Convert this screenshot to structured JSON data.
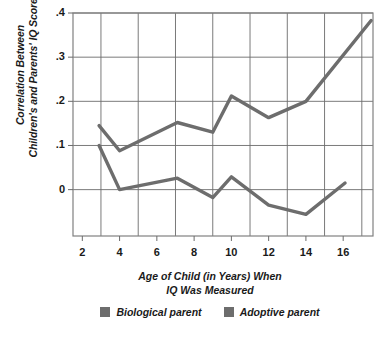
{
  "chart_data": {
    "type": "line",
    "title": "",
    "xlabel": "Age of Child (in Years) When IQ Was Measured",
    "xlabel_line1": "Age of Child (in Years) When",
    "xlabel_line2": "IQ Was Measured",
    "ylabel": "Correlation Between Children's and Parents' IQ Scores",
    "ylabel_line1": "Correlation Between",
    "ylabel_line2": "Children's and Parents' IQ Scores",
    "xlim": [
      1.5,
      17.6
    ],
    "ylim": [
      -0.105,
      0.4
    ],
    "xticks": [
      2,
      4,
      6,
      8,
      10,
      12,
      14,
      16
    ],
    "xtick_labels": [
      "2",
      "4",
      "6",
      "8",
      "10",
      "12",
      "14",
      "16"
    ],
    "yticks": [
      0,
      0.1,
      0.2,
      0.3,
      0.4
    ],
    "ytick_labels": [
      "0",
      ".1",
      ".2",
      ".3",
      ".4"
    ],
    "grid": true,
    "legend_position": "bottom",
    "line_color": "#6d6d6d",
    "grid_color": "#6b6b6b",
    "series": [
      {
        "name": "Biological parent",
        "color": "#6d6d6d",
        "x": [
          2.9,
          4.0,
          7.1,
          9.0,
          10.0,
          12.0,
          14.0,
          17.5
        ],
        "values": [
          0.145,
          0.088,
          0.152,
          0.13,
          0.212,
          0.163,
          0.2,
          0.383
        ]
      },
      {
        "name": "Adoptive parent",
        "color": "#6d6d6d",
        "x": [
          2.9,
          4.0,
          7.1,
          9.0,
          10.0,
          12.0,
          14.0,
          16.1
        ],
        "values": [
          0.1,
          0.0,
          0.026,
          -0.018,
          0.029,
          -0.035,
          -0.056,
          0.015
        ]
      }
    ]
  },
  "legend": {
    "items": [
      {
        "label": "Biological parent",
        "swatch_color": "#6d6d6d"
      },
      {
        "label": "Adoptive parent",
        "swatch_color": "#6d6d6d"
      }
    ]
  }
}
